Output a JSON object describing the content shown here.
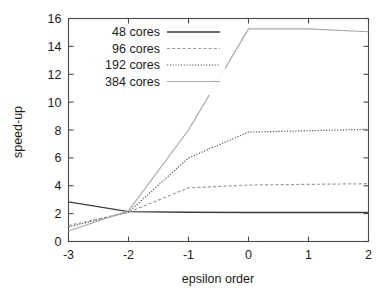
{
  "chart_data": {
    "type": "line",
    "title": "",
    "xlabel": "epsilon order",
    "ylabel": "speed-up",
    "x": [
      -3,
      -2,
      -1,
      0,
      1,
      2
    ],
    "xlim": [
      -3,
      2
    ],
    "ylim": [
      0,
      16
    ],
    "xticks": [
      "-3",
      "-2",
      "-1",
      "0",
      "1",
      "2"
    ],
    "yticks": [
      "0",
      "2",
      "4",
      "6",
      "8",
      "10",
      "12",
      "14",
      "16"
    ],
    "grid": false,
    "legend_position": "top-left",
    "series": [
      {
        "name": "48 cores",
        "values": [
          2.85,
          2.15,
          2.1,
          2.08,
          2.08,
          2.08
        ],
        "color": "#3c3c3c",
        "dash": "none",
        "width": 1.3
      },
      {
        "name": "96 cores",
        "values": [
          1.15,
          2.1,
          3.85,
          4.05,
          4.1,
          4.15
        ],
        "color": "#9a9a9a",
        "dash": "3,2.2",
        "width": 1.2
      },
      {
        "name": "192 cores",
        "values": [
          1.05,
          2.1,
          6.0,
          7.85,
          7.95,
          8.05
        ],
        "color": "#575757",
        "dash": "1.2,1.6",
        "width": 1.2
      },
      {
        "name": "384 cores",
        "values": [
          0.75,
          2.2,
          8.0,
          15.25,
          15.25,
          15.05
        ],
        "color": "#a8a8a8",
        "dash": "none",
        "width": 1.2
      }
    ]
  },
  "axes": {
    "ylabel": "speed-up",
    "xlabel": "epsilon order"
  },
  "legend": {
    "entries": [
      {
        "label": "48 cores"
      },
      {
        "label": "96 cores"
      },
      {
        "label": "192 cores"
      },
      {
        "label": "384 cores"
      }
    ]
  }
}
